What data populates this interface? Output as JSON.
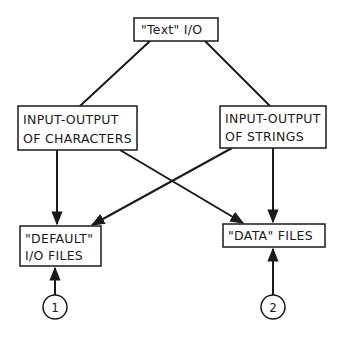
{
  "diagram": {
    "nodes": {
      "text_io": {
        "lines": [
          "\"Text\" I/O"
        ]
      },
      "chars": {
        "lines": [
          "INPUT-OUTPUT",
          "OF CHARACTERS"
        ]
      },
      "strings": {
        "lines": [
          "INPUT-OUTPUT",
          "OF STRINGS"
        ]
      },
      "default_files": {
        "lines": [
          "\"DEFAULT\"",
          "I/O FILES"
        ]
      },
      "data_files": {
        "lines": [
          "\"DATA\" FILES"
        ]
      }
    },
    "markers": {
      "one": "1",
      "two": "2"
    },
    "edges": [
      {
        "from": "text_io",
        "to": "chars",
        "arrow": false
      },
      {
        "from": "text_io",
        "to": "strings",
        "arrow": false
      },
      {
        "from": "chars",
        "to": "default_files",
        "arrow": true
      },
      {
        "from": "chars",
        "to": "data_files",
        "arrow": true
      },
      {
        "from": "strings",
        "to": "default_files",
        "arrow": true
      },
      {
        "from": "strings",
        "to": "data_files",
        "arrow": true
      },
      {
        "from": "marker_1",
        "to": "default_files",
        "arrow": true
      },
      {
        "from": "marker_2",
        "to": "data_files",
        "arrow": true
      }
    ],
    "colors": {
      "line": "#1a1a1a",
      "background": "#ffffff"
    }
  }
}
